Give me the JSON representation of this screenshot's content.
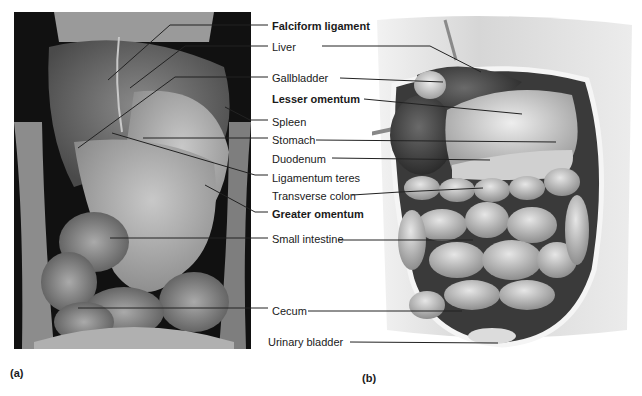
{
  "figure": {
    "panel_a_label": "(a)",
    "panel_b_label": "(b)",
    "panel_a_description": "Cadaver photograph of the opened abdominal cavity",
    "panel_b_description": "Illustration of the abdominal organs in situ"
  },
  "labels": [
    {
      "text": "Falciform ligament",
      "bold": true
    },
    {
      "text": "Liver",
      "bold": false
    },
    {
      "text": "Gallbladder",
      "bold": false
    },
    {
      "text": "Lesser omentum",
      "bold": true
    },
    {
      "text": "Spleen",
      "bold": false
    },
    {
      "text": "Stomach",
      "bold": false
    },
    {
      "text": "Duodenum",
      "bold": false
    },
    {
      "text": "Ligamentum teres",
      "bold": false
    },
    {
      "text": "Transverse colon",
      "bold": false
    },
    {
      "text": "Greater omentum",
      "bold": true
    },
    {
      "text": "Small intestine",
      "bold": false
    },
    {
      "text": "Cecum",
      "bold": false
    },
    {
      "text": "Urinary bladder",
      "bold": false
    }
  ],
  "colors": {
    "background": "#ffffff",
    "text": "#1a1a1a",
    "leader_line": "#222222",
    "photo_bg": "#0d0d0d"
  }
}
